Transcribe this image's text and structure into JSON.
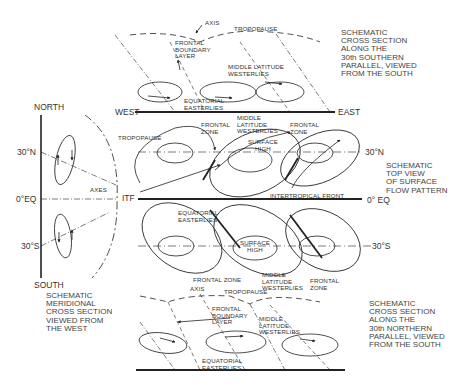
{
  "figure": {
    "colors": {
      "ink": "#222222",
      "background": "#ffffff"
    },
    "captions": {
      "top_section": "SCHEMATIC\nCROSS SECTION\nALONG THE\n30th SOUTHERN\nPARALLEL, VIEWED\nFROM THE SOUTH",
      "top_view": "SCHEMATIC\nTOP VIEW\nOF SURFACE\nFLOW PATTERN",
      "bottom_section": "SCHEMATIC\nCROSS SECTION\nALONG THE\n30th NORTHERN\nPARALLEL, VIEWED\nFROM THE SOUTH",
      "meridional": "SCHEMATIC\nMERIDIONAL\nCROSS SECTION\nVIEWED FROM\nTHE WEST"
    },
    "top_section": {
      "axis": "AXIS",
      "tropopause": "TROPOPAUSE",
      "frontal_boundary_layer": "FRONTAL\nBOUNDARY\nLAYER",
      "middle_latitude_westerlies": "MIDDLE LATITUDE\nWESTERLIES",
      "equatorial_easterlies": "EQUATORIAL\nEASTERLIES",
      "west": "WEST",
      "east": "EAST"
    },
    "top_view": {
      "frontal_zone_left": "FRONTAL\nZONE",
      "middle_latitude_westerlies": "MIDDLE\nLATITUDE\nWESTERLIES",
      "frontal_zone_right": "FRONTAL\nZONE",
      "tropopause": "TROPOPAUSE",
      "surface_high_north": "SURFACE\nHIGH",
      "lat_30n": "30°N",
      "axes": "AXES",
      "itf": "ITF",
      "intertropical_front": "INTERTROPICAL FRONT",
      "equator": "0° EQ",
      "equatorial_easterlies": "EQUATORIAL\nEASTERLIES",
      "surface_high_south": "SURFACE\nHIGH",
      "lat_30s": "30°S",
      "frontal_zone_bottom": "FRONTAL ZONE",
      "middle_latitude_westerlies_bottom": "MIDDLE\nLATITUDE\nWESTERLIES",
      "frontal_zone_bottom_right": "FRONTAL\nZONE"
    },
    "meridional": {
      "north": "NORTH",
      "south": "SOUTH",
      "lat_30n": "30°N",
      "equator": "0°EQ",
      "lat_30s": "30°S"
    },
    "bottom_section": {
      "axis": "AXIS",
      "tropopause": "TROPOPAUSE",
      "frontal_boundary_layer": "FRONTAL\nBOUNDARY\nLAYER",
      "middle_latitude_westerlies": "MIDDLE\nLATITUDE\nWESTERLIES",
      "equatorial_easterlies": "EQUATORIAL\nEASTERLIES"
    }
  }
}
